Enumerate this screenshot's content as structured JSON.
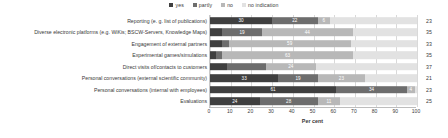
{
  "legend": {
    "items": [
      {
        "key": "yes",
        "label": "yes",
        "color": "#3f3f3f"
      },
      {
        "key": "partly",
        "label": "partly",
        "color": "#6d6d6d"
      },
      {
        "key": "no",
        "label": "no",
        "color": "#b8b8b8"
      },
      {
        "key": "no_indication",
        "label": "no indication",
        "color": "#e2e2e2"
      }
    ]
  },
  "axis": {
    "xlabel": "Per cent",
    "ticks": [
      "0",
      "10",
      "20",
      "30",
      "40",
      "50",
      "60",
      "70",
      "80",
      "90",
      "100"
    ]
  },
  "chart_data": {
    "type": "bar",
    "title": "",
    "subtitle": "",
    "orientation": "horizontal",
    "stacked": true,
    "xlabel": "Per cent",
    "ylabel": "",
    "xlim": [
      0,
      100
    ],
    "grid": true,
    "legend_position": "top-center",
    "categories": [
      "Reporting (e. g. list of publications)",
      "Diverse electronic platforms (e.g. WiKis; BSCW-Servers, Knowledge Maps)",
      "Engagement of external partners",
      "Experimental games/simulations",
      "Direct visits of/contacts to customers",
      "Personal conversations (external scientific community)",
      "Personal conversations (internal with employees)",
      "Evaluations"
    ],
    "series": [
      {
        "name": "yes",
        "values": [
          30,
          6,
          6,
          3,
          8,
          33,
          61,
          24
        ]
      },
      {
        "name": "partly",
        "values": [
          22,
          19,
          3,
          3,
          19,
          19,
          34,
          28
        ]
      },
      {
        "name": "no",
        "values": [
          6,
          44,
          59,
          63,
          24,
          23,
          4,
          11
        ]
      },
      {
        "name": "no indication",
        "values": [
          42,
          31,
          32,
          31,
          49,
          25,
          1,
          37
        ]
      }
    ],
    "data_labels": [
      {
        "category": "Reporting (e. g. list of publications)",
        "yes": "30",
        "partly": "22",
        "no": "6",
        "no_indication": ""
      },
      {
        "category": "Diverse electronic platforms (e.g. WiKis; BSCW-Servers, Knowledge Maps)",
        "yes": "",
        "partly": "19",
        "no": "44",
        "no_indication": ""
      },
      {
        "category": "Engagement of external partners",
        "yes": "",
        "partly": "",
        "no": "59",
        "no_indication": ""
      },
      {
        "category": "Experimental games/simulations",
        "yes": "",
        "partly": "",
        "no": "63",
        "no_indication": ""
      },
      {
        "category": "Direct visits of/contacts to customers",
        "yes": "",
        "partly": "",
        "no": "24",
        "no_indication": ""
      },
      {
        "category": "Personal conversations (external scientific community)",
        "yes": "33",
        "partly": "19",
        "no": "23",
        "no_indication": ""
      },
      {
        "category": "Personal conversations (internal with employees)",
        "yes": "61",
        "partly": "34",
        "no": "4",
        "no_indication": ""
      },
      {
        "category": "Evaluations",
        "yes": "24",
        "partly": "28",
        "no": "11",
        "no_indication": ""
      }
    ],
    "n_column_header": "",
    "n_values": [
      "23",
      "35",
      "33",
      "35",
      "37",
      "21",
      "23",
      "25"
    ]
  }
}
